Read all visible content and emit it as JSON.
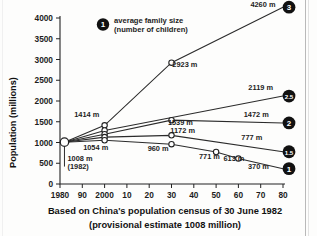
{
  "figure": {
    "caption_line1": "Based on China's population census of 30 June 1982",
    "caption_line2": "(provisional estimate 1008 million)",
    "legend": {
      "badge": "1",
      "line1": "average family size",
      "line2": "(number of children)"
    }
  },
  "chart_data": {
    "type": "line",
    "title": "",
    "xlabel": "",
    "ylabel": "Population (millions)",
    "xlim": [
      1980,
      2080
    ],
    "ylim": [
      0,
      4000
    ],
    "grid": false,
    "legend_position": "upper-left-inset",
    "x_tick_values": [
      1980,
      1990,
      2000,
      2010,
      2020,
      2030,
      2040,
      2050,
      2060,
      2070,
      2080
    ],
    "x_tick_labels": [
      "1980",
      "90",
      "2000",
      "10",
      "20",
      "30",
      "40",
      "50",
      "60",
      "70",
      "80"
    ],
    "y_tick_values": [
      0,
      500,
      1000,
      1500,
      2000,
      2500,
      3000,
      3500,
      4000
    ],
    "y_tick_labels": [
      "0",
      "500",
      "1000",
      "1500",
      "2000",
      "2500",
      "3000",
      "3500",
      "4000"
    ],
    "baseline": {
      "x": 1982,
      "y": 1008,
      "label": "1008 m",
      "sublabel": "(1982)"
    },
    "series": [
      {
        "name": "3",
        "badge": "3",
        "end_label": "4260 m",
        "x": [
          1982,
          2000,
          2030,
          2080
        ],
        "values": [
          1008,
          1414,
          2923,
          4260
        ],
        "labels": [
          "",
          "1414 m",
          "2923 m",
          "4260 m"
        ]
      },
      {
        "name": "2.5",
        "badge": "2.5",
        "end_label": "2119 m",
        "x": [
          1982,
          2000,
          2080
        ],
        "values": [
          1008,
          1290,
          2119
        ],
        "labels": [
          "",
          "",
          "2119 m"
        ]
      },
      {
        "name": "2",
        "badge": "2",
        "end_label": "1472 m",
        "x": [
          1982,
          2000,
          2030,
          2080
        ],
        "values": [
          1008,
          1200,
          1539,
          1472
        ],
        "labels": [
          "",
          "",
          "1539 m",
          "1472 m"
        ]
      },
      {
        "name": "1.5",
        "badge": "1.5",
        "end_label": "777 m",
        "x": [
          1982,
          2000,
          2030,
          2080
        ],
        "values": [
          1008,
          1130,
          1172,
          777
        ],
        "labels": [
          "",
          "",
          "1172 m",
          "777 m"
        ]
      },
      {
        "name": "1",
        "badge": "1",
        "end_label": "370 m",
        "x": [
          1982,
          2000,
          2030,
          2050,
          2060,
          2080
        ],
        "values": [
          1008,
          1054,
          960,
          771,
          613,
          370
        ],
        "labels": [
          "",
          "1054 m",
          "960 m",
          "771 m",
          "613 m",
          "370 m"
        ]
      }
    ],
    "annotations": [
      {
        "text": "4260 m",
        "x": 2071,
        "y": 4260
      },
      {
        "text": "2923 m",
        "x": 2036,
        "y": 2830
      },
      {
        "text": "2119 m",
        "x": 2070,
        "y": 2270
      },
      {
        "text": "1472 m",
        "x": 2068,
        "y": 1610
      },
      {
        "text": "1539 m",
        "x": 2034,
        "y": 1430
      },
      {
        "text": "1414 m",
        "x": 1992,
        "y": 1620
      },
      {
        "text": "1172 m",
        "x": 2035,
        "y": 1230
      },
      {
        "text": "1054 m",
        "x": 1996,
        "y": 830
      },
      {
        "text": "960 m",
        "x": 2024,
        "y": 800
      },
      {
        "text": "777 m",
        "x": 2066,
        "y": 1060
      },
      {
        "text": "771 m",
        "x": 2047,
        "y": 600
      },
      {
        "text": "613 m",
        "x": 2058,
        "y": 560
      },
      {
        "text": "370 m",
        "x": 2069,
        "y": 370
      }
    ]
  }
}
